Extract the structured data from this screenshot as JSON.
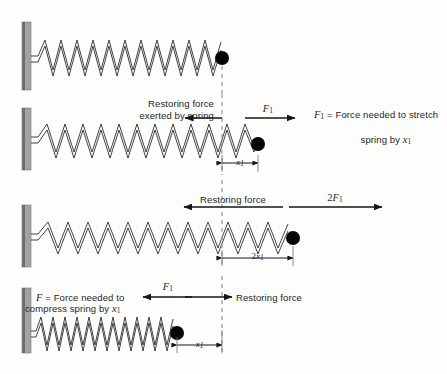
{
  "figure": {
    "background_color": "#fdfdfc",
    "ink_color": "#1a1a1a",
    "wall_color": "#9b9b9b",
    "wall_edge_color": "#5c5c5c",
    "spring_color": "#2b2b2b",
    "ball_color": "#000000",
    "dashed_line_color": "#9a9a9a"
  },
  "panels": [
    {
      "id": "relaxed",
      "caption": "Spring at natural (relaxed) length",
      "spring_state": "relaxed",
      "ball_x": 222,
      "coils": 12
    },
    {
      "id": "stretched-x1",
      "caption": "Spring stretched by x1",
      "spring_state": "stretched",
      "ball_x": 258,
      "coils": 13,
      "restoring_label_line1": "Restoring force",
      "restoring_label_line2": "exerted by spring",
      "applied_force_label": "F",
      "applied_force_sub": "1",
      "legend_symbol": "F",
      "legend_symbol_sub": "1",
      "legend_eq": " = ",
      "legend_line1": "Force needed to stretch",
      "legend_line2_pre": "spring by ",
      "legend_line2_sym": "x",
      "legend_line2_sub": "1",
      "dimension_label_sym": "x",
      "dimension_label_sub": "1"
    },
    {
      "id": "stretched-2x1",
      "caption": "Spring stretched by 2x1",
      "spring_state": "stretched-double",
      "ball_x": 293,
      "coils": 13,
      "restoring_label": "Restoring force",
      "applied_force_prefix": "2",
      "applied_force_label": "F",
      "applied_force_sub": "1",
      "dimension_label_prefix": "2",
      "dimension_label_sym": "x",
      "dimension_label_sub": "1"
    },
    {
      "id": "compressed-x1",
      "caption": "Spring compressed by x1",
      "spring_state": "compressed",
      "ball_x": 177,
      "coils": 13,
      "legend_symbol": "F",
      "legend_eq": " = ",
      "legend_line1": "Force needed to",
      "legend_line2_pre": "compress spring by ",
      "legend_line2_sym": "x",
      "legend_line2_sub": "1",
      "applied_force_label": "F",
      "applied_force_sub": "1",
      "restoring_label": "Restoring force",
      "dimension_label_sym": "x",
      "dimension_label_sub": "1"
    }
  ],
  "equilibrium_line_x": 222
}
